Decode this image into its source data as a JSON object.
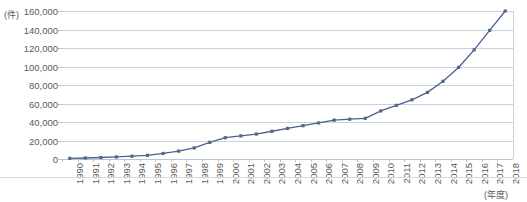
{
  "chart_data": {
    "type": "line",
    "title": "",
    "xlabel": "(年度)",
    "ylabel": "(件)",
    "ylim": [
      0,
      160000
    ],
    "ytick_step": 20000,
    "ytick_labels": [
      "160,000",
      "140,000",
      "120,000",
      "100,000",
      "80,000",
      "60,000",
      "40,000",
      "20,000",
      "0"
    ],
    "ytick_values": [
      160000,
      140000,
      120000,
      100000,
      80000,
      60000,
      40000,
      20000,
      0
    ],
    "grid": true,
    "legend": "none",
    "marker": "square",
    "line_color": "#4a5f96",
    "marker_color": "#57677f",
    "grid_color": "#c5d2e2",
    "categories": [
      "1990",
      "1991",
      "1992",
      "1993",
      "1994",
      "1995",
      "1996",
      "1997",
      "1998",
      "1999",
      "2000",
      "2001",
      "2002",
      "2003",
      "2004",
      "2005",
      "2006",
      "2007",
      "2008",
      "2009",
      "2010",
      "2011",
      "2012",
      "2013",
      "2014",
      "2015",
      "2016",
      "2017",
      "2018"
    ],
    "series": [
      {
        "name": "件数",
        "values": [
          700,
          1100,
          1600,
          2200,
          3000,
          4000,
          6000,
          8500,
          12000,
          18000,
          23000,
          25000,
          27000,
          30000,
          33000,
          36000,
          39000,
          42000,
          43000,
          44000,
          52000,
          58000,
          64000,
          72000,
          84000,
          99000,
          118000,
          139000,
          160000
        ]
      }
    ]
  },
  "axis": {
    "y_unit_label": "(件)",
    "x_unit_label": "(年度)"
  }
}
